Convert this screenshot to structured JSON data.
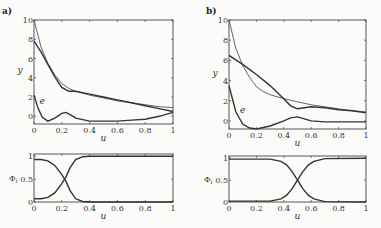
{
  "chart_data": [
    {
      "panel": "a)",
      "type": "line",
      "title": "",
      "xlabel": "u",
      "ylabel": "y",
      "xlim": [
        0,
        1
      ],
      "ylim": [
        -0.8,
        10
      ],
      "xticks": [
        0,
        0.2,
        0.4,
        0.6,
        0.8,
        1
      ],
      "yticks": [
        0,
        2,
        4,
        6,
        8,
        10
      ],
      "annotations": [
        {
          "text": "e",
          "x": 0.04,
          "y": 1.3
        }
      ],
      "series": [
        {
          "name": "target",
          "style": "thin",
          "x": [
            0,
            0.05,
            0.1,
            0.15,
            0.2,
            0.25,
            0.3,
            0.4,
            0.5,
            0.6,
            0.7,
            0.8,
            0.9,
            1
          ],
          "values": [
            10,
            7.2,
            5.5,
            4.3,
            3.4,
            2.9,
            2.6,
            2.2,
            1.9,
            1.6,
            1.4,
            1.2,
            1.0,
            0.9
          ]
        },
        {
          "name": "approximation",
          "style": "thick",
          "x": [
            0,
            0.05,
            0.1,
            0.15,
            0.2,
            0.25,
            0.3,
            0.4,
            0.5,
            0.6,
            0.7,
            0.8,
            0.9,
            1
          ],
          "values": [
            7.8,
            6.7,
            5.4,
            4.1,
            3.0,
            2.6,
            2.6,
            2.3,
            2.0,
            1.7,
            1.4,
            1.1,
            0.8,
            0.5
          ]
        },
        {
          "name": "e",
          "style": "thick",
          "x": [
            0,
            0.03,
            0.06,
            0.1,
            0.15,
            0.2,
            0.23,
            0.27,
            0.3,
            0.4,
            0.5,
            0.6,
            0.7,
            0.8,
            0.9,
            1
          ],
          "values": [
            2.2,
            0.8,
            -0.1,
            -0.5,
            -0.2,
            0.3,
            0.4,
            0.1,
            -0.2,
            -0.5,
            -0.5,
            -0.5,
            -0.4,
            -0.3,
            -0.0,
            0.4
          ]
        }
      ]
    },
    {
      "panel": "a)",
      "type": "line",
      "xlabel": "u",
      "ylabel": "Φi",
      "xlim": [
        0,
        1
      ],
      "ylim": [
        0,
        1.05
      ],
      "xticks": [
        0,
        0.2,
        0.4,
        0.6,
        0.8,
        1
      ],
      "yticks": [
        0,
        0.5,
        1
      ],
      "series": [
        {
          "name": "Φ1",
          "x": [
            0,
            0.05,
            0.1,
            0.15,
            0.2,
            0.23,
            0.26,
            0.3,
            0.35,
            0.4,
            1
          ],
          "values": [
            0.93,
            0.93,
            0.9,
            0.8,
            0.6,
            0.45,
            0.25,
            0.07,
            0.01,
            0,
            0
          ]
        },
        {
          "name": "Φ2",
          "x": [
            0,
            0.05,
            0.1,
            0.15,
            0.2,
            0.23,
            0.26,
            0.3,
            0.35,
            0.4,
            1
          ],
          "values": [
            0.07,
            0.07,
            0.1,
            0.2,
            0.4,
            0.55,
            0.75,
            0.93,
            0.99,
            1,
            1
          ]
        }
      ]
    },
    {
      "panel": "b)",
      "type": "line",
      "xlabel": "u",
      "ylabel": "y",
      "xlim": [
        0,
        1
      ],
      "ylim": [
        -0.8,
        10
      ],
      "xticks": [
        0,
        0.2,
        0.4,
        0.6,
        0.8,
        1
      ],
      "yticks": [
        0,
        2,
        4,
        6,
        8,
        10
      ],
      "annotations": [
        {
          "text": "e",
          "x": 0.08,
          "y": 0.8
        }
      ],
      "series": [
        {
          "name": "target",
          "style": "thin",
          "x": [
            0,
            0.05,
            0.1,
            0.15,
            0.2,
            0.25,
            0.3,
            0.4,
            0.5,
            0.6,
            0.7,
            0.8,
            0.9,
            1
          ],
          "values": [
            10,
            7.2,
            5.5,
            4.3,
            3.4,
            2.9,
            2.6,
            2.2,
            1.9,
            1.6,
            1.4,
            1.2,
            1.0,
            0.9
          ]
        },
        {
          "name": "approximation",
          "style": "thick",
          "x": [
            0,
            0.1,
            0.2,
            0.3,
            0.4,
            0.45,
            0.5,
            0.55,
            0.6,
            0.7,
            0.8,
            0.9,
            1
          ],
          "values": [
            6.5,
            5.6,
            4.6,
            3.5,
            2.2,
            1.5,
            1.2,
            1.3,
            1.4,
            1.3,
            1.1,
            1.0,
            0.8
          ]
        },
        {
          "name": "e",
          "style": "thick",
          "x": [
            0,
            0.05,
            0.1,
            0.15,
            0.2,
            0.3,
            0.4,
            0.45,
            0.5,
            0.55,
            0.6,
            0.7,
            0.8,
            0.9,
            1
          ],
          "values": [
            3.5,
            0.9,
            -0.3,
            -0.7,
            -0.8,
            -0.5,
            0.0,
            0.3,
            0.4,
            0.2,
            0.0,
            -0.1,
            -0.1,
            -0.1,
            -0.1
          ]
        }
      ]
    },
    {
      "panel": "b)",
      "type": "line",
      "xlabel": "u",
      "ylabel": "Φi",
      "xlim": [
        0,
        1
      ],
      "ylim": [
        0,
        1.05
      ],
      "xticks": [
        0,
        0.2,
        0.4,
        0.6,
        0.8,
        1
      ],
      "yticks": [
        0,
        0.5,
        1
      ],
      "series": [
        {
          "name": "Φ1",
          "x": [
            0,
            0.3,
            0.38,
            0.42,
            0.46,
            0.5,
            0.54,
            0.58,
            0.62,
            0.7,
            1
          ],
          "values": [
            0.98,
            0.98,
            0.93,
            0.85,
            0.7,
            0.5,
            0.3,
            0.15,
            0.07,
            0.01,
            0
          ]
        },
        {
          "name": "Φ2",
          "x": [
            0,
            0.3,
            0.38,
            0.42,
            0.46,
            0.5,
            0.54,
            0.58,
            0.62,
            0.7,
            1
          ],
          "values": [
            0.02,
            0.02,
            0.07,
            0.15,
            0.3,
            0.5,
            0.7,
            0.85,
            0.93,
            0.99,
            1
          ]
        }
      ]
    }
  ],
  "labels": {
    "panel_a": "a)",
    "panel_b": "b)",
    "y": "y",
    "u": "u",
    "phi": "Φ",
    "phi_sub": "i",
    "e": "e"
  }
}
